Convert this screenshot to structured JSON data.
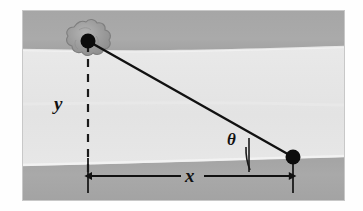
{
  "figure": {
    "labels": {
      "vertical_distance": "y",
      "horizontal_distance": "x",
      "angle": "θ"
    },
    "elements": {
      "bush": "bush-shape",
      "far_point": "far-bank-point",
      "near_point": "near-bank-point",
      "sight_line": "line-of-sight",
      "vertical_dashed": "vertical-dashed-line",
      "horizontal_measure": "horizontal-double-arrow",
      "angle_arc": "angle-arc"
    },
    "colors": {
      "bank": "#a8a8a8",
      "bank_edge_highlight": "#efefef",
      "water": "#e4e4e4",
      "water_light": "#ededed",
      "ink": "#111111",
      "frame": "#cfcfcf",
      "page": "#ffffff",
      "bush_fill": "#9a9a9a",
      "bush_stroke": "#7d7d7d"
    },
    "geometry": {
      "frame": {
        "x": 22,
        "y": 10,
        "width": 323,
        "height": 191
      },
      "top_bank": {
        "y0": 10,
        "y1": 51
      },
      "water": {
        "y0": 51,
        "y1": 163
      },
      "bottom_bank": {
        "y0": 163,
        "y1": 201
      },
      "far_point": {
        "x": 88,
        "y": 41
      },
      "near_point": {
        "x": 293,
        "y": 157
      },
      "measure_line_y": 176,
      "dot_radius": 7
    }
  }
}
